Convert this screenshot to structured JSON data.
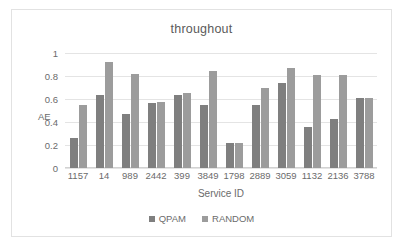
{
  "chart_data": {
    "type": "bar",
    "title": "throughout",
    "xlabel": "Service ID",
    "ylabel": "AE",
    "categories": [
      "1157",
      "14",
      "989",
      "2442",
      "399",
      "3849",
      "1798",
      "2889",
      "3059",
      "1132",
      "2136",
      "3788"
    ],
    "series": [
      {
        "name": "QPAM",
        "color": "#7f7f7f",
        "values": [
          0.26,
          0.635,
          0.47,
          0.565,
          0.635,
          0.545,
          0.22,
          0.55,
          0.74,
          0.355,
          0.425,
          0.605
        ]
      },
      {
        "name": "RANDOM",
        "color": "#9c9c9c",
        "values": [
          0.545,
          0.92,
          0.815,
          0.575,
          0.65,
          0.845,
          0.22,
          0.7,
          0.87,
          0.805,
          0.81,
          0.605
        ]
      }
    ],
    "ylim": [
      0,
      1
    ],
    "yticks": [
      "0",
      "0.2",
      "0.4",
      "0.6",
      "0.8",
      "1"
    ],
    "ytick_values": [
      0,
      0.2,
      0.4,
      0.6,
      0.8,
      1
    ],
    "grid": true,
    "legend_position": "bottom"
  },
  "frame": {
    "border_color": "#e2e2e2",
    "background": "#ffffff"
  }
}
